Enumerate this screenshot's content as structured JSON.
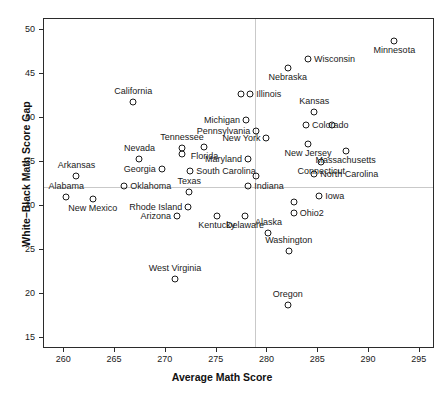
{
  "chart_data": {
    "type": "scatter",
    "title": "",
    "xlabel": "Average Math Score",
    "ylabel": "White–Black Math Score Gap",
    "xlim": [
      258,
      296.5
    ],
    "ylim": [
      13.8,
      51.3
    ],
    "xticks": [
      260,
      265,
      270,
      275,
      280,
      285,
      290,
      295
    ],
    "yticks": [
      15,
      20,
      25,
      30,
      35,
      40,
      45,
      50
    ],
    "grid": false,
    "legend": null,
    "reference_lines": {
      "vertical_x": 278.8,
      "horizontal_y": 32.2
    },
    "points": [
      {
        "label": "Minnesota",
        "x": 292.5,
        "y": 48.8,
        "label_pos": "s"
      },
      {
        "label": "Wisconsin",
        "x": 284.0,
        "y": 46.7,
        "label_pos": "e"
      },
      {
        "label": "Nebraska",
        "x": 282.0,
        "y": 45.7,
        "label_pos": "s"
      },
      {
        "label": "Illinois",
        "x": 277.4,
        "y": 42.8,
        "label_pos": "none"
      },
      {
        "label": "Illinois",
        "x": 278.3,
        "y": 42.8,
        "label_pos": "e"
      },
      {
        "label": "California",
        "x": 266.8,
        "y": 41.9,
        "label_pos": "n"
      },
      {
        "label": "Michigan",
        "x": 277.9,
        "y": 39.8,
        "label_pos": "w"
      },
      {
        "label": "Kansas",
        "x": 284.6,
        "y": 40.7,
        "label_pos": "n"
      },
      {
        "label": "Colorado",
        "x": 283.8,
        "y": 39.3,
        "label_pos": "e"
      },
      {
        "label": "Pennsylvania",
        "x": 278.9,
        "y": 38.6,
        "label_pos": "w"
      },
      {
        "label": "Colorado2",
        "x": 286.4,
        "y": 39.3,
        "label_pos": "none"
      },
      {
        "label": "New York",
        "x": 279.9,
        "y": 37.8,
        "label_pos": "w"
      },
      {
        "label": "New Jersey",
        "x": 284.0,
        "y": 37.1,
        "label_pos": "s"
      },
      {
        "label": "Tennessee",
        "x": 271.6,
        "y": 36.6,
        "label_pos": "n"
      },
      {
        "label": "Tennessee2",
        "x": 271.6,
        "y": 36.0,
        "label_pos": "none"
      },
      {
        "label": "Florida",
        "x": 273.8,
        "y": 36.8,
        "label_pos": "s"
      },
      {
        "label": "Nevada",
        "x": 267.4,
        "y": 35.4,
        "label_pos": "n"
      },
      {
        "label": "Arkansas",
        "x": 261.2,
        "y": 33.5,
        "label_pos": "n"
      },
      {
        "label": "Maryland",
        "x": 278.1,
        "y": 35.4,
        "label_pos": "w"
      },
      {
        "label": "Connecticut",
        "x": 285.3,
        "y": 35.1,
        "label_pos": "s"
      },
      {
        "label": "Massachusetts",
        "x": 287.7,
        "y": 36.3,
        "label_pos": "s"
      },
      {
        "label": "Georgia",
        "x": 269.6,
        "y": 34.2,
        "label_pos": "w"
      },
      {
        "label": "South Carolina",
        "x": 272.4,
        "y": 34.0,
        "label_pos": "e"
      },
      {
        "label": "North Carolina",
        "x": 284.6,
        "y": 33.7,
        "label_pos": "e"
      },
      {
        "label": "Maryland2",
        "x": 278.9,
        "y": 33.5,
        "label_pos": "none"
      },
      {
        "label": "Alabama",
        "x": 260.2,
        "y": 31.1,
        "label_pos": "n"
      },
      {
        "label": "Oklahoma",
        "x": 265.9,
        "y": 32.3,
        "label_pos": "e"
      },
      {
        "label": "Indiana",
        "x": 278.1,
        "y": 32.3,
        "label_pos": "e"
      },
      {
        "label": "Texas",
        "x": 272.3,
        "y": 31.6,
        "label_pos": "n"
      },
      {
        "label": "New Mexico",
        "x": 262.8,
        "y": 30.9,
        "label_pos": "s"
      },
      {
        "label": "Iowa",
        "x": 285.1,
        "y": 31.2,
        "label_pos": "e"
      },
      {
        "label": "Rhode Island",
        "x": 272.2,
        "y": 29.9,
        "label_pos": "w"
      },
      {
        "label": "Ohio",
        "x": 282.6,
        "y": 30.5,
        "label_pos": "none"
      },
      {
        "label": "Ohio2",
        "x": 282.6,
        "y": 29.2,
        "label_pos": "e"
      },
      {
        "label": "Arizona",
        "x": 271.1,
        "y": 28.9,
        "label_pos": "w"
      },
      {
        "label": "Kentucky",
        "x": 275.0,
        "y": 28.9,
        "label_pos": "s"
      },
      {
        "label": "Delaware",
        "x": 277.8,
        "y": 28.9,
        "label_pos": "s"
      },
      {
        "label": "Alaska",
        "x": 280.1,
        "y": 27.0,
        "label_pos": "n"
      },
      {
        "label": "Washington",
        "x": 282.1,
        "y": 24.9,
        "label_pos": "n"
      },
      {
        "label": "West Virginia",
        "x": 270.9,
        "y": 21.8,
        "label_pos": "n"
      },
      {
        "label": "Oregon",
        "x": 282.0,
        "y": 18.8,
        "label_pos": "n"
      }
    ],
    "visible_labels": [
      "California",
      "Michigan",
      "Illinois",
      "Kansas",
      "Wisconsin",
      "Minnesota",
      "Nebraska",
      "Pennsylvania",
      "New York",
      "Colorado",
      "New Jersey",
      "Nevada",
      "Tennessee",
      "Florida",
      "Arkansas",
      "Maryland",
      "Connecticut",
      "Massachusetts",
      "Georgia",
      "South Carolina",
      "North Carolina",
      "Alabama",
      "Oklahoma",
      "Indiana",
      "Texas",
      "Iowa",
      "New Mexico",
      "Rhode Island",
      "Ohio",
      "Arizona",
      "Kentucky",
      "Delaware",
      "Alaska",
      "Washington",
      "West Virginia",
      "Oregon"
    ]
  }
}
